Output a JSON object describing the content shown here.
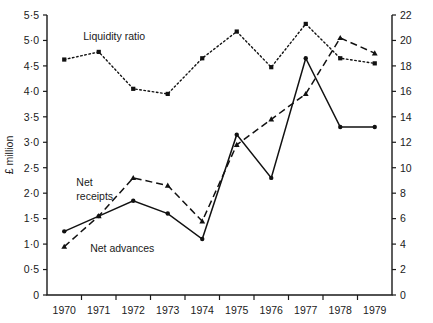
{
  "chart_data": {
    "type": "line",
    "title": "",
    "subtitle": "",
    "xlabel": "",
    "ylabel": "£ million",
    "ylabel_right": "",
    "categories": [
      "1970",
      "1971",
      "1972",
      "1973",
      "1974",
      "1975",
      "1976",
      "1977",
      "1978",
      "1979"
    ],
    "x": [
      1970,
      1971,
      1972,
      1973,
      1974,
      1975,
      1976,
      1977,
      1978,
      1979
    ],
    "ylim": [
      0,
      5.5
    ],
    "yticks": [
      0,
      0.5,
      1.0,
      1.5,
      2.0,
      2.5,
      3.0,
      3.5,
      4.0,
      4.5,
      5.0,
      5.5
    ],
    "ytick_labels": [
      "0",
      "0·5",
      "1·0",
      "1·5",
      "2·0",
      "2·5",
      "3·0",
      "3·5",
      "4·0",
      "4·5",
      "5·0",
      "5·5"
    ],
    "ylim_right": [
      0,
      22
    ],
    "yticks_right": [
      0,
      2,
      4,
      6,
      8,
      10,
      12,
      14,
      16,
      18,
      20,
      22
    ],
    "ytick_labels_right": [
      "0",
      "2",
      "4",
      "6",
      "8",
      "10",
      "12",
      "14",
      "16",
      "18",
      "20",
      "22"
    ],
    "grid": false,
    "legend_position": "inline-annotations",
    "series": [
      {
        "name": "Liquidity ratio",
        "axis": "right",
        "style": "dotted",
        "marker": "filled-square",
        "values": [
          18.5,
          19.1,
          16.2,
          15.8,
          18.6,
          20.7,
          17.9,
          21.3,
          18.6,
          18.2
        ]
      },
      {
        "name": "Net receipts",
        "axis": "left",
        "style": "dashed",
        "marker": "filled-triangle",
        "values": [
          0.95,
          1.55,
          2.3,
          2.15,
          1.45,
          2.95,
          3.45,
          3.95,
          5.05,
          4.75
        ]
      },
      {
        "name": "Net advances",
        "axis": "left",
        "style": "solid",
        "marker": "filled-dot",
        "values": [
          1.25,
          1.55,
          1.85,
          1.6,
          1.1,
          3.15,
          2.3,
          4.65,
          3.3,
          3.3
        ]
      }
    ],
    "annotations": [
      {
        "text": "Liquidity ratio",
        "x": 1970.55,
        "y_px": 40
      },
      {
        "text": "Net",
        "x": 1970.35,
        "y_px": 186
      },
      {
        "text": "receipts",
        "x": 1970.35,
        "y_px": 200
      },
      {
        "text": "Net advances",
        "x": 1970.75,
        "y_px": 252
      }
    ]
  },
  "axes": {
    "left_title": "£ million"
  }
}
